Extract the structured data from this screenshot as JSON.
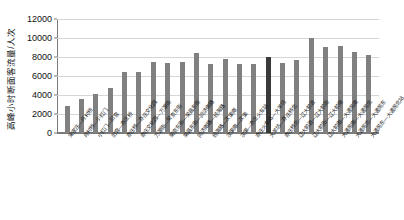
{
  "chart_data": {
    "type": "bar",
    "title": "",
    "xlabel": "",
    "ylabel": "高峰小时断面客流量/人次",
    "ylim": [
      0,
      12000
    ],
    "ytick_step": 2000,
    "yticks": [
      "0",
      "2000",
      "4000",
      "6000",
      "8000",
      "10000",
      "12000"
    ],
    "grid": true,
    "legend": "none",
    "bar_color": "#808080",
    "highlight_color": "#3a3a3a",
    "highlight_index": 14,
    "categories": [
      "宋家庄—肖村桥",
      "肖村桥—小红门",
      "小红门—旧宫",
      "旧宫—亦庄桥",
      "亦庄桥—亦庄文化园",
      "亦庄文化园—万源街",
      "万源街—荣京东街",
      "荣京东街—荣昌东街",
      "荣昌东街—同济南路",
      "同济南路—经海路",
      "经海路—次渠南",
      "次渠南—次渠",
      "次渠—亦庄火车站",
      "亦庄火车站—大羊坊",
      "大羊坊—亦庄桥北",
      "亦庄桥北—辽大前进",
      "辽大前进—辽大前街",
      "辽大前街—辽大前南",
      "辽大前南—大通苑南",
      "大通苑南—大通苑北",
      "大通苑北—大通苑东",
      "大通苑东—大通苑北站"
    ],
    "values": [
      2800,
      3600,
      4100,
      4700,
      6400,
      6400,
      7500,
      7400,
      7500,
      8400,
      7300,
      7800,
      7300,
      7300,
      8000,
      7400,
      7700,
      10000,
      9100,
      9200,
      8500,
      8200
    ]
  }
}
